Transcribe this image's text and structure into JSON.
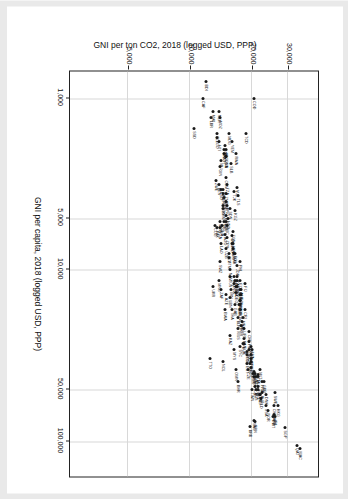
{
  "chart_data": {
    "type": "scatter",
    "title": "",
    "xlabel": "GNI per capita, 2018 (logged USD, PPP)",
    "ylabel": "GNI per ton CO2, 2018 (logged USD, PPP)",
    "xscale": "log",
    "yscale": "log",
    "xlim": [
      700,
      160000
    ],
    "ylim": [
      2600,
      42000
    ],
    "xticks": [
      1000,
      5000,
      10000,
      50000,
      100000
    ],
    "xticklabels": [
      "1,000",
      "5,000",
      "10,000",
      "50,000",
      "100,000"
    ],
    "yticks": [
      5000,
      10000,
      20000,
      30000
    ],
    "yticklabels": [
      "5,000",
      "10,000",
      "20,000",
      "30,000"
    ],
    "grid": true,
    "legend": "none",
    "point_color": "#1a1a1a",
    "grid_color": "#d8d8d8",
    "frame_color": "#222222",
    "points": [
      {
        "code": "MAC",
        "x": 110000,
        "y": 34500
      },
      {
        "code": "QAT",
        "x": 105000,
        "y": 33000
      },
      {
        "code": "SGP",
        "x": 83000,
        "y": 29000
      },
      {
        "code": "CHE",
        "x": 62000,
        "y": 25500
      },
      {
        "code": "NOR",
        "x": 66000,
        "y": 24000
      },
      {
        "code": "IRL",
        "x": 72000,
        "y": 26000
      },
      {
        "code": "SWE",
        "x": 52000,
        "y": 25800
      },
      {
        "code": "DNK",
        "x": 53000,
        "y": 23500
      },
      {
        "code": "USA",
        "x": 62000,
        "y": 23500
      },
      {
        "code": "ARE",
        "x": 70000,
        "y": 25500
      },
      {
        "code": "KWT",
        "x": 72000,
        "y": 25300
      },
      {
        "code": "MLT",
        "x": 38000,
        "y": 22000
      },
      {
        "code": "FRA",
        "x": 45000,
        "y": 22500
      },
      {
        "code": "GBR",
        "x": 45000,
        "y": 23000
      },
      {
        "code": "AUT",
        "x": 52000,
        "y": 22500
      },
      {
        "code": "NLD",
        "x": 56000,
        "y": 22200
      },
      {
        "code": "FIN",
        "x": 48000,
        "y": 21500
      },
      {
        "code": "ISL",
        "x": 53000,
        "y": 22000
      },
      {
        "code": "ITA",
        "x": 41000,
        "y": 21500
      },
      {
        "code": "LUX",
        "x": 42000,
        "y": 21500
      },
      {
        "code": "DEU",
        "x": 53000,
        "y": 21800
      },
      {
        "code": "BEL",
        "x": 50000,
        "y": 21500
      },
      {
        "code": "ESP",
        "x": 40000,
        "y": 20800
      },
      {
        "code": "CAN",
        "x": 48000,
        "y": 20800
      },
      {
        "code": "AUS",
        "x": 50000,
        "y": 21000
      },
      {
        "code": "NZL",
        "x": 42000,
        "y": 21000
      },
      {
        "code": "JPN",
        "x": 42000,
        "y": 20600
      },
      {
        "code": "KOR",
        "x": 40000,
        "y": 20200
      },
      {
        "code": "BRN",
        "x": 77000,
        "y": 20800
      },
      {
        "code": "SAU",
        "x": 75000,
        "y": 20600
      },
      {
        "code": "BRB",
        "x": 82000,
        "y": 19500
      },
      {
        "code": "LVA",
        "x": 29000,
        "y": 20100
      },
      {
        "code": "ROU",
        "x": 28000,
        "y": 19700
      },
      {
        "code": "LTU",
        "x": 33000,
        "y": 19800
      },
      {
        "code": "PRT",
        "x": 34000,
        "y": 19900
      },
      {
        "code": "SVK",
        "x": 31000,
        "y": 19700
      },
      {
        "code": "CZE",
        "x": 38000,
        "y": 19200
      },
      {
        "code": "HUN",
        "x": 30000,
        "y": 19000
      },
      {
        "code": "POL",
        "x": 31000,
        "y": 19000
      },
      {
        "code": "EST",
        "x": 35000,
        "y": 19000
      },
      {
        "code": "GRC",
        "x": 29000,
        "y": 19400
      },
      {
        "code": "SVN",
        "x": 35000,
        "y": 19500
      },
      {
        "code": "HRV",
        "x": 26000,
        "y": 19400
      },
      {
        "code": "RUS",
        "x": 27000,
        "y": 18200
      },
      {
        "code": "CHL",
        "x": 23000,
        "y": 19300
      },
      {
        "code": "FIJ",
        "x": 12000,
        "y": 18600
      },
      {
        "code": "URY",
        "x": 22000,
        "y": 18400
      },
      {
        "code": "MEX",
        "x": 19000,
        "y": 18200
      },
      {
        "code": "TUR",
        "x": 27000,
        "y": 18400
      },
      {
        "code": "BGR",
        "x": 21000,
        "y": 17800
      },
      {
        "code": "CRI",
        "x": 17000,
        "y": 18500
      },
      {
        "code": "PAN",
        "x": 25000,
        "y": 18300
      },
      {
        "code": "ARG",
        "x": 20000,
        "y": 18000
      },
      {
        "code": "BIH",
        "x": 14000,
        "y": 17600
      },
      {
        "code": "MKD",
        "x": 15000,
        "y": 17600
      },
      {
        "code": "SRB",
        "x": 16000,
        "y": 17500
      },
      {
        "code": "ALB",
        "x": 13000,
        "y": 17800
      },
      {
        "code": "BLR",
        "x": 19000,
        "y": 17200
      },
      {
        "code": "KAZ",
        "x": 24000,
        "y": 15600
      },
      {
        "code": "CHN",
        "x": 16000,
        "y": 17400
      },
      {
        "code": "THA",
        "x": 17000,
        "y": 16000
      },
      {
        "code": "BRA",
        "x": 15000,
        "y": 17500
      },
      {
        "code": "COL",
        "x": 14000,
        "y": 17800
      },
      {
        "code": "PER",
        "x": 13000,
        "y": 17600
      },
      {
        "code": "ECU",
        "x": 11500,
        "y": 17500
      },
      {
        "code": "DOM",
        "x": 17000,
        "y": 17600
      },
      {
        "code": "JOR",
        "x": 9500,
        "y": 17000
      },
      {
        "code": "IRN",
        "x": 13000,
        "y": 15800
      },
      {
        "code": "IRQ",
        "x": 11000,
        "y": 16400
      },
      {
        "code": "EGY",
        "x": 11500,
        "y": 16500
      },
      {
        "code": "ZAF",
        "x": 13000,
        "y": 14200
      },
      {
        "code": "MNG",
        "x": 11500,
        "y": 13800
      },
      {
        "code": "UKR",
        "x": 12500,
        "y": 13000
      },
      {
        "code": "PRY",
        "x": 12500,
        "y": 17000
      },
      {
        "code": "IDN",
        "x": 11000,
        "y": 17000
      },
      {
        "code": "LKA",
        "x": 12500,
        "y": 16800
      },
      {
        "code": "PHL",
        "x": 9000,
        "y": 17600
      },
      {
        "code": "VNM",
        "x": 7500,
        "y": 16200
      },
      {
        "code": "IND",
        "x": 7000,
        "y": 16000
      },
      {
        "code": "BOL",
        "x": 8000,
        "y": 16600
      },
      {
        "code": "MAR",
        "x": 8000,
        "y": 16400
      },
      {
        "code": "UZB",
        "x": 7500,
        "y": 15000
      },
      {
        "code": "GTM",
        "x": 8500,
        "y": 15500
      },
      {
        "code": "SLV",
        "x": 8000,
        "y": 15400
      },
      {
        "code": "HND",
        "x": 5000,
        "y": 15300
      },
      {
        "code": "NIC",
        "x": 5500,
        "y": 15200
      },
      {
        "code": "CPV",
        "x": 6500,
        "y": 15200
      },
      {
        "code": "TUN",
        "x": 11000,
        "y": 15600
      },
      {
        "code": "GHA",
        "x": 5500,
        "y": 14300
      },
      {
        "code": "KEN",
        "x": 4200,
        "y": 14500
      },
      {
        "code": "NGA",
        "x": 5700,
        "y": 14000
      },
      {
        "code": "PAK",
        "x": 5700,
        "y": 13500
      },
      {
        "code": "BGD",
        "x": 4800,
        "y": 14900
      },
      {
        "code": "NPL",
        "x": 3400,
        "y": 14400
      },
      {
        "code": "KHM",
        "x": 4400,
        "y": 14400
      },
      {
        "code": "MMR",
        "x": 5200,
        "y": 14000
      },
      {
        "code": "LAO",
        "x": 7000,
        "y": 14200
      },
      {
        "code": "SEN",
        "x": 3600,
        "y": 14500
      },
      {
        "code": "CIV",
        "x": 5200,
        "y": 14900
      },
      {
        "code": "CMR",
        "x": 3800,
        "y": 14700
      },
      {
        "code": "ZMB",
        "x": 3600,
        "y": 14900
      },
      {
        "code": "TZA",
        "x": 3200,
        "y": 15200
      },
      {
        "code": "UGA",
        "x": 2200,
        "y": 14900
      },
      {
        "code": "ETH",
        "x": 2100,
        "y": 14600
      },
      {
        "code": "RWA",
        "x": 2100,
        "y": 16700
      },
      {
        "code": "TLS",
        "x": 3700,
        "y": 17200
      },
      {
        "code": "VUT",
        "x": 3300,
        "y": 16900
      },
      {
        "code": "SWZ",
        "x": 9000,
        "y": 14000
      },
      {
        "code": "MLI",
        "x": 2300,
        "y": 14200
      },
      {
        "code": "MOZ",
        "x": 1300,
        "y": 14000
      },
      {
        "code": "BEN",
        "x": 3200,
        "y": 13800
      },
      {
        "code": "TGO",
        "x": 1700,
        "y": 13500
      },
      {
        "code": "AFG",
        "x": 2000,
        "y": 14900
      },
      {
        "code": "SLE",
        "x": 1600,
        "y": 13600
      },
      {
        "code": "NER",
        "x": 1200,
        "y": 13900
      },
      {
        "code": "TCD",
        "x": 1600,
        "y": 18800
      },
      {
        "code": "LBR",
        "x": 1300,
        "y": 12600
      },
      {
        "code": "BDI",
        "x": 800,
        "y": 12000
      },
      {
        "code": "CAF",
        "x": 1000,
        "y": 11500
      },
      {
        "code": "COD",
        "x": 1000,
        "y": 20500
      },
      {
        "code": "SSD",
        "x": 1500,
        "y": 10500
      },
      {
        "code": "MWI",
        "x": 1200,
        "y": 13000
      },
      {
        "code": "HTI",
        "x": 1800,
        "y": 13800
      },
      {
        "code": "TTO",
        "x": 33000,
        "y": 12500
      },
      {
        "code": "OMN",
        "x": 38000,
        "y": 16800
      },
      {
        "code": "BHR",
        "x": 45000,
        "y": 17200
      },
      {
        "code": "AZE",
        "x": 14000,
        "y": 15000
      },
      {
        "code": "GEO",
        "x": 13500,
        "y": 16800
      },
      {
        "code": "ARM",
        "x": 11500,
        "y": 17000
      },
      {
        "code": "MDA",
        "x": 7000,
        "y": 16200
      },
      {
        "code": "KGZ",
        "x": 4500,
        "y": 16600
      },
      {
        "code": "TJK",
        "x": 3500,
        "y": 16400
      },
      {
        "code": "MDG",
        "x": 1600,
        "y": 15400
      },
      {
        "code": "BFA",
        "x": 2000,
        "y": 14600
      },
      {
        "code": "GIN",
        "x": 2500,
        "y": 14000
      },
      {
        "code": "YEM",
        "x": 1800,
        "y": 16000
      },
      {
        "code": "SDN",
        "x": 4400,
        "y": 15600
      },
      {
        "code": "COG",
        "x": 5500,
        "y": 13200
      },
      {
        "code": "AGO",
        "x": 6200,
        "y": 14800
      },
      {
        "code": "BWA",
        "x": 17000,
        "y": 14800
      },
      {
        "code": "NAM",
        "x": 10000,
        "y": 15600
      },
      {
        "code": "GAB",
        "x": 16000,
        "y": 16600
      },
      {
        "code": "DZA",
        "x": 12000,
        "y": 16400
      },
      {
        "code": "LBN",
        "x": 14500,
        "y": 15700
      },
      {
        "code": "MYS",
        "x": 29000,
        "y": 16400
      },
      {
        "code": "MUS",
        "x": 22000,
        "y": 17200
      },
      {
        "code": "SYC",
        "x": 28000,
        "y": 17600
      },
      {
        "code": "CYP",
        "x": 37000,
        "y": 19800
      },
      {
        "code": "ISR",
        "x": 39000,
        "y": 20400
      },
      {
        "code": "HKG",
        "x": 62000,
        "y": 26800
      },
      {
        "code": "TWN",
        "x": 50000,
        "y": 20000
      },
      {
        "code": "NCL",
        "x": 34000,
        "y": 14500
      },
      {
        "code": "PNG",
        "x": 4200,
        "y": 15200
      },
      {
        "code": "SLB",
        "x": 2400,
        "y": 15800
      },
      {
        "code": "WSM",
        "x": 6300,
        "y": 16000
      },
      {
        "code": "TON",
        "x": 6000,
        "y": 16200
      },
      {
        "code": "KIR",
        "x": 4000,
        "y": 15000
      },
      {
        "code": "GMB",
        "x": 2200,
        "y": 15000
      },
      {
        "code": "GNB",
        "x": 1900,
        "y": 14800
      },
      {
        "code": "MRT",
        "x": 5200,
        "y": 14600
      },
      {
        "code": "ZWE",
        "x": 3000,
        "y": 13400
      },
      {
        "code": "LSO",
        "x": 3400,
        "y": 14200
      },
      {
        "code": "COM",
        "x": 2900,
        "y": 15000
      }
    ]
  }
}
